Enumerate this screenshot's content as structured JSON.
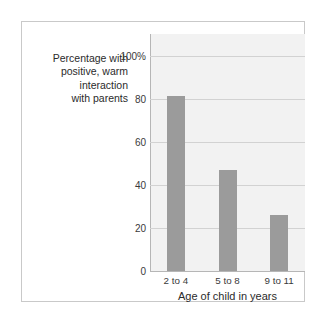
{
  "chart_data": {
    "type": "bar",
    "title": "",
    "categories": [
      "2 to 4",
      "5 to 8",
      "9 to 11"
    ],
    "values": [
      81,
      47,
      26
    ],
    "xlabel": "Age of child in years",
    "ylabel": "Percentage with positive, warm interaction with parents",
    "ylim": [
      0,
      110
    ],
    "yticks": [
      0,
      20,
      40,
      60,
      80,
      100
    ],
    "ytick_labels": [
      "0",
      "20",
      "40",
      "60",
      "80",
      "100%"
    ],
    "grid": true,
    "legend": false,
    "colors": {
      "bar": "#9b9b9b",
      "plot_background": "#f2f2f2",
      "gridline": "#d2d2d2",
      "axis": "#b6b6b6",
      "frame": "#c9c9c9",
      "text": "#2b2b2b"
    }
  },
  "axis": {
    "ylabel_text": "Percentage with\npositive, warm\ninteraction\nwith parents",
    "xlabel_text": "Age of child in years"
  }
}
